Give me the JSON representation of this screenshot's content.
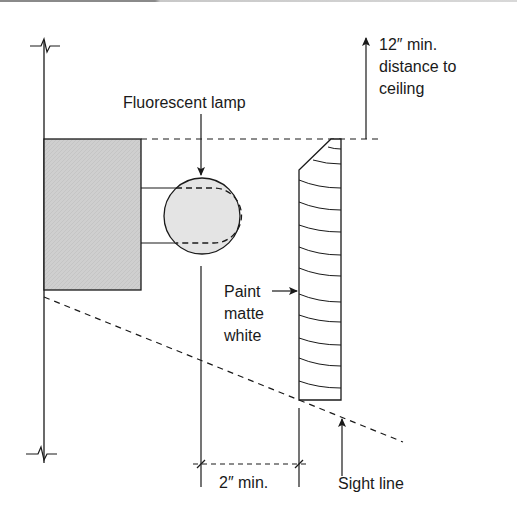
{
  "diagram": {
    "type": "section-detail",
    "labels": {
      "lamp": "Fluorescent lamp",
      "ceiling_line1": "12″ min.",
      "ceiling_line2": "distance to",
      "ceiling_line3": "ceiling",
      "paint_line1": "Paint",
      "paint_line2": "matte",
      "paint_line3": "white",
      "dimension": "2″ min.",
      "sight_line": "Sight line"
    },
    "colors": {
      "stroke": "#1a1a1a",
      "box_fill": "#cfcfcf",
      "lamp_fill": "#e4e4e4",
      "background": "#ffffff"
    },
    "elements": [
      "wall-line",
      "wall-break-top",
      "wall-break-bottom",
      "mounting-box",
      "lamp-bracket",
      "fluorescent-lamp",
      "valance-board",
      "ceiling-clearance-arrow",
      "sight-line",
      "dimension-2in"
    ]
  }
}
